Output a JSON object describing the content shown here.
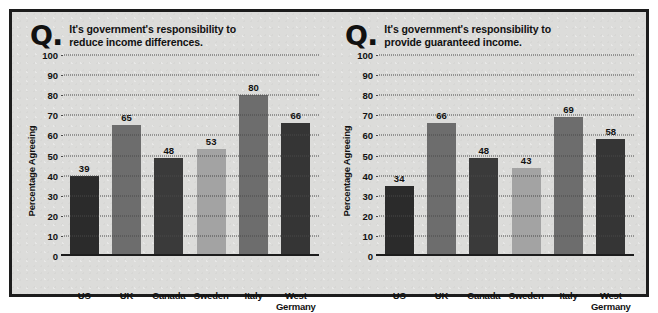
{
  "figure": {
    "background_color": "#dcdcda",
    "border_color": "#1c1c1c",
    "q_glyph": "Q",
    "q_dot": "."
  },
  "chart_data": [
    {
      "type": "bar",
      "title": "It's government's responsibility to reduce income differences.",
      "title_line1": "It's government's responsibility to",
      "title_line2": "reduce income differences.",
      "categories": [
        "US",
        "UK",
        "Canada",
        "Sweden",
        "Italy",
        "West Germany"
      ],
      "category_lines": [
        {
          "line1": "US",
          "line2": ""
        },
        {
          "line1": "UK",
          "line2": ""
        },
        {
          "line1": "Canada",
          "line2": ""
        },
        {
          "line1": "Sweden",
          "line2": ""
        },
        {
          "line1": "Italy",
          "line2": ""
        },
        {
          "line1": "West",
          "line2": "Germany"
        }
      ],
      "values": [
        39,
        65,
        48,
        53,
        80,
        66
      ],
      "bar_colors": [
        "#2b2b2b",
        "#6d6d6d",
        "#3a3a3a",
        "#a3a3a3",
        "#6d6d6d",
        "#353535"
      ],
      "xlabel": "",
      "ylabel": "Percentage Agreeing",
      "ylim": [
        0,
        100
      ],
      "yticks": [
        100,
        90,
        80,
        70,
        60,
        50,
        40,
        30,
        20,
        10,
        0
      ],
      "grid": true,
      "grid_style": "dotted",
      "legend": "none"
    },
    {
      "type": "bar",
      "title": "It's government's responsibility to provide guaranteed income.",
      "title_line1": "It's government's responsibility to",
      "title_line2": "provide guaranteed income.",
      "categories": [
        "US",
        "UK",
        "Canada",
        "Sweden",
        "Italy",
        "West Germany"
      ],
      "category_lines": [
        {
          "line1": "US",
          "line2": ""
        },
        {
          "line1": "UK",
          "line2": ""
        },
        {
          "line1": "Canada",
          "line2": ""
        },
        {
          "line1": "Sweden",
          "line2": ""
        },
        {
          "line1": "Italy",
          "line2": ""
        },
        {
          "line1": "West",
          "line2": "Germany"
        }
      ],
      "values": [
        34,
        66,
        48,
        43,
        69,
        58
      ],
      "bar_colors": [
        "#2b2b2b",
        "#6d6d6d",
        "#3a3a3a",
        "#a3a3a3",
        "#6d6d6d",
        "#353535"
      ],
      "xlabel": "",
      "ylabel": "Percentage Agreeing",
      "ylim": [
        0,
        100
      ],
      "yticks": [
        100,
        90,
        80,
        70,
        60,
        50,
        40,
        30,
        20,
        10,
        0
      ],
      "grid": true,
      "grid_style": "dotted",
      "legend": "none"
    }
  ]
}
